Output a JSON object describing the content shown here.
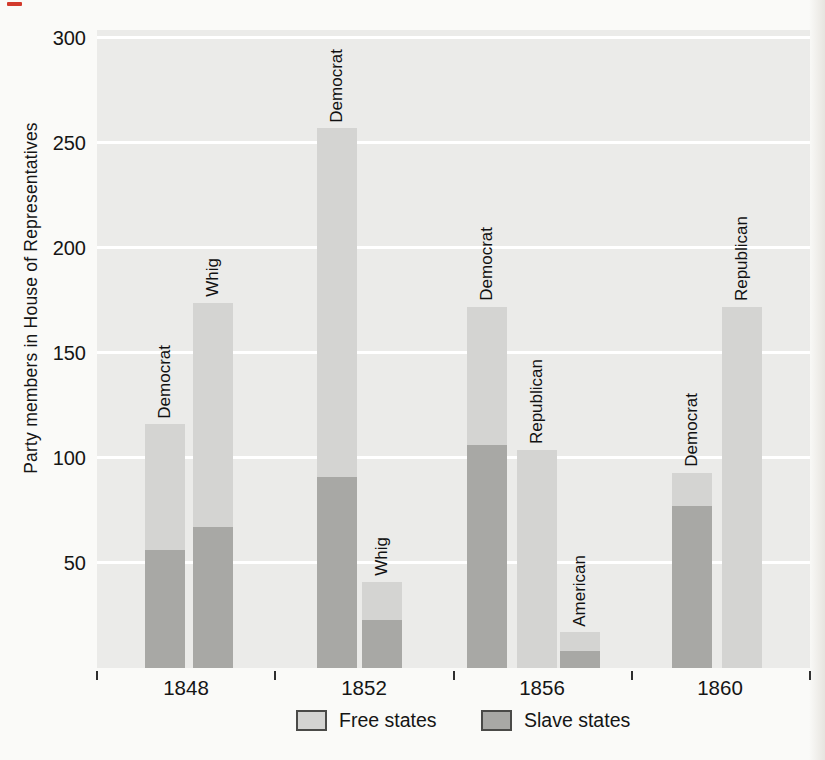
{
  "chart_data": {
    "type": "bar",
    "stacked": true,
    "title": "",
    "xlabel": "",
    "ylabel": "Party members in House of Representatives",
    "ylim": [
      0,
      304
    ],
    "yticks": [
      50,
      100,
      150,
      200,
      250,
      300
    ],
    "grid": "horizontal white gridlines on gray plot background",
    "legend": {
      "position": "bottom",
      "entries": [
        {
          "label": "Free states",
          "color": "#d4d4d2"
        },
        {
          "label": "Slave states",
          "color": "#a8a8a5"
        }
      ]
    },
    "groups": [
      {
        "year": "1848",
        "bars": [
          {
            "party": "Democrat",
            "free": 60,
            "slave": 56,
            "total": 116
          },
          {
            "party": "Whig",
            "free": 107,
            "slave": 67,
            "total": 174
          }
        ]
      },
      {
        "year": "1852",
        "bars": [
          {
            "party": "Democrat",
            "free": 166,
            "slave": 91,
            "total": 257
          },
          {
            "party": "Whig",
            "free": 18,
            "slave": 23,
            "total": 41
          }
        ]
      },
      {
        "year": "1856",
        "bars": [
          {
            "party": "Democrat",
            "free": 66,
            "slave": 106,
            "total": 172
          },
          {
            "party": "Republican",
            "free": 104,
            "slave": 0,
            "total": 104
          },
          {
            "party": "American",
            "free": 9,
            "slave": 8,
            "total": 17
          }
        ]
      },
      {
        "year": "1860",
        "bars": [
          {
            "party": "Democrat",
            "free": 16,
            "slave": 77,
            "total": 93
          },
          {
            "party": "Republican",
            "free": 172,
            "slave": 0,
            "total": 172
          }
        ]
      }
    ],
    "colors": {
      "free_states": "#d4d4d2",
      "slave_states": "#a8a8a5",
      "plot_background": "#ebebe9",
      "gridline": "#ffffff",
      "text": "#151515"
    }
  }
}
